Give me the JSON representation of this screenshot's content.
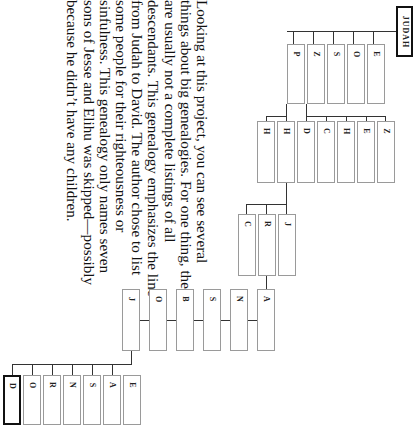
{
  "diagram": {
    "root": {
      "label": "JUDAH"
    },
    "gen1": {
      "labels": [
        "E",
        "O",
        "S",
        "Z",
        "P"
      ]
    },
    "gen2": {
      "labels": [
        "H",
        "H",
        "D",
        "C",
        "H",
        "E",
        "Z"
      ]
    },
    "gen3": {
      "labels": [
        "C",
        "R",
        "J"
      ]
    },
    "chain": {
      "labels": [
        "A",
        "N",
        "S",
        "B",
        "O",
        "J"
      ]
    },
    "sons_of_jesse": {
      "labels": [
        "E",
        "A",
        "S",
        "N",
        "R",
        "O",
        "D"
      ]
    },
    "highlighted": "D"
  },
  "text": {
    "paragraph": "Looking at this project, you can see several things about big genealogies. For one thing, they are usually not a complete listings of all descendants. This genealogy emphasizes the line from Judah to David. The author chose to list some people for their righteousness or sinfulness. This genealogy only names seven sons of Jesse and Elihu was skipped—possibly because he didn’t have any children."
  }
}
